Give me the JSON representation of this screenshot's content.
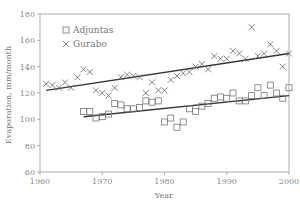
{
  "chart_data": {
    "type": "scatter",
    "title": "",
    "xlabel": "Year",
    "ylabel": "Evaporation, mm/month",
    "xlim": [
      1960,
      2000
    ],
    "ylim": [
      60,
      180
    ],
    "xticks": [
      1960,
      1970,
      1980,
      1990,
      2000
    ],
    "yticks": [
      60,
      80,
      100,
      120,
      140,
      160,
      180
    ],
    "grid": false,
    "legend_position": "upper-left",
    "series": [
      {
        "name": "Adjuntas",
        "marker": "square",
        "x": [
          1967,
          1968,
          1969,
          1970,
          1971,
          1972,
          1973,
          1974,
          1975,
          1976,
          1977,
          1978,
          1979,
          1980,
          1981,
          1982,
          1983,
          1984,
          1985,
          1986,
          1987,
          1988,
          1989,
          1990,
          1991,
          1992,
          1993,
          1994,
          1995,
          1996,
          1997,
          1998,
          1999,
          2000
        ],
        "y": [
          106,
          106,
          101,
          102,
          104,
          112,
          111,
          108,
          108,
          109,
          114,
          113,
          114,
          98,
          101,
          94,
          98,
          108,
          106,
          110,
          112,
          116,
          117,
          116,
          120,
          114,
          114,
          118,
          124,
          118,
          126,
          120,
          116,
          124
        ],
        "trend": {
          "x": [
            1967,
            2000
          ],
          "y": [
            102,
            118
          ]
        }
      },
      {
        "name": "Gurabo",
        "marker": "x",
        "x": [
          1961,
          1962,
          1963,
          1964,
          1965,
          1966,
          1967,
          1968,
          1969,
          1970,
          1971,
          1972,
          1973,
          1974,
          1975,
          1976,
          1977,
          1978,
          1979,
          1980,
          1981,
          1982,
          1983,
          1984,
          1985,
          1986,
          1987,
          1988,
          1989,
          1990,
          1991,
          1992,
          1993,
          1994,
          1995,
          1996,
          1997,
          1998,
          1999,
          2000
        ],
        "y": [
          127,
          126,
          124,
          128,
          124,
          132,
          138,
          136,
          122,
          120,
          118,
          124,
          132,
          134,
          133,
          132,
          120,
          128,
          122,
          122,
          130,
          133,
          135,
          136,
          140,
          142,
          138,
          148,
          146,
          146,
          152,
          150,
          146,
          170,
          148,
          150,
          157,
          152,
          140,
          150
        ],
        "trend": {
          "x": [
            1961,
            2000
          ],
          "y": [
            122,
            150
          ]
        }
      }
    ]
  }
}
